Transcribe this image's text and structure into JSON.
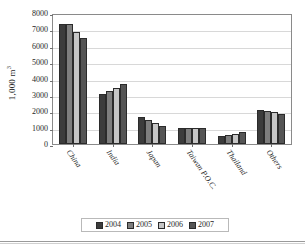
{
  "chart_data": {
    "type": "bar",
    "title": "",
    "xlabel": "",
    "ylabel": "1,000 m",
    "ylabel_sup": "3",
    "ylim": [
      0,
      8000
    ],
    "ytick_step": 1000,
    "yticks": [
      "8000",
      "7000",
      "6000",
      "5000",
      "4000",
      "3000",
      "2000",
      "1000",
      "0"
    ],
    "grid": true,
    "legend_position": "bottom",
    "categories": [
      "China",
      "India",
      "Japan",
      "Taiwan P.O.C.",
      "Thailand",
      "Others"
    ],
    "series": [
      {
        "name": "2004",
        "color": "#3c3c3c",
        "values": [
          7300,
          3030,
          1620,
          1000,
          490,
          2050
        ]
      },
      {
        "name": "2005",
        "color": "#7e7e7e",
        "values": [
          7300,
          3240,
          1440,
          960,
          540,
          2000
        ]
      },
      {
        "name": "2006",
        "color": "#c6c6c6",
        "values": [
          6850,
          3440,
          1280,
          960,
          630,
          1960
        ]
      },
      {
        "name": "2007",
        "color": "#555555",
        "values": [
          6500,
          3650,
          1080,
          960,
          740,
          1860
        ]
      }
    ]
  },
  "legend": {
    "items": [
      {
        "label": "2004"
      },
      {
        "label": "2005"
      },
      {
        "label": "2006"
      },
      {
        "label": "2007"
      }
    ]
  }
}
